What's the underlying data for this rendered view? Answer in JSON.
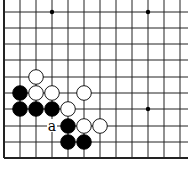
{
  "diagram": {
    "type": "go-board-fragment",
    "board_color": "#ffffff",
    "line_color": "#222222",
    "edges": {
      "left": true,
      "bottom": true,
      "top": false,
      "right": false
    },
    "grid": {
      "columns_x": [
        4,
        20,
        36,
        52,
        68,
        84,
        100,
        116,
        132,
        148,
        164,
        180
      ],
      "rows_y": [
        12,
        28,
        44,
        60,
        77,
        93,
        109,
        126,
        142,
        158
      ]
    },
    "star_points": [
      {
        "col": 3,
        "row": 0
      },
      {
        "col": 9,
        "row": 0
      },
      {
        "col": 9,
        "row": 6
      }
    ],
    "stones": [
      {
        "color": "white",
        "col": 2,
        "row": 4
      },
      {
        "color": "black",
        "col": 1,
        "row": 5
      },
      {
        "color": "white",
        "col": 2,
        "row": 5
      },
      {
        "color": "white",
        "col": 3,
        "row": 5
      },
      {
        "color": "white",
        "col": 5,
        "row": 5
      },
      {
        "color": "black",
        "col": 1,
        "row": 6
      },
      {
        "color": "black",
        "col": 2,
        "row": 6
      },
      {
        "color": "black",
        "col": 3,
        "row": 6
      },
      {
        "color": "white",
        "col": 4,
        "row": 6
      },
      {
        "color": "black",
        "col": 4,
        "row": 7
      },
      {
        "color": "white",
        "col": 5,
        "row": 7
      },
      {
        "color": "white",
        "col": 6,
        "row": 7
      },
      {
        "color": "black",
        "col": 4,
        "row": 8
      },
      {
        "color": "black",
        "col": 5,
        "row": 8
      }
    ],
    "labels": [
      {
        "text": "a",
        "col": 3,
        "row": 7
      }
    ]
  }
}
